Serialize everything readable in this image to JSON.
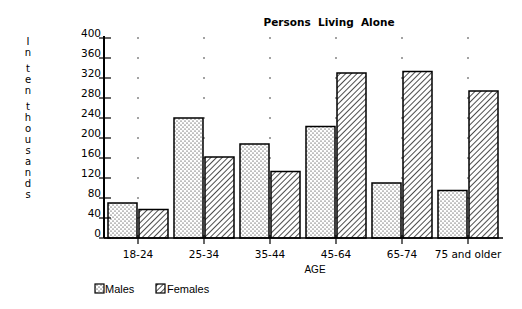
{
  "chart_data": {
    "type": "bar",
    "title": "Persons  Living  Alone",
    "xlabel": "AGE",
    "ylabel": "In ten thousands",
    "ylabel_stacked": [
      "I",
      "n",
      "",
      "t",
      "e",
      "n",
      "",
      "t",
      "h",
      "o",
      "u",
      "s",
      "a",
      "n",
      "d",
      "s"
    ],
    "categories": [
      "18-24",
      "25-34",
      "35-44",
      "45-64",
      "65-74",
      "75 and older"
    ],
    "series": [
      {
        "name": "Males",
        "pattern": "dots",
        "values": [
          70,
          240,
          188,
          223,
          110,
          95
        ]
      },
      {
        "name": "Females",
        "pattern": "diagonal-hatch",
        "values": [
          57,
          162,
          133,
          330,
          333,
          294
        ]
      }
    ],
    "ylim": [
      0,
      400
    ],
    "yticks": [
      0,
      40,
      80,
      120,
      160,
      200,
      240,
      280,
      320,
      360,
      400
    ],
    "grid": "dotted points at tick levels",
    "legend_position": "bottom-left"
  },
  "legend": {
    "items": [
      {
        "label": "Males",
        "pattern": "dots"
      },
      {
        "label": "Females",
        "pattern": "diagonal-hatch"
      }
    ]
  },
  "colors": {
    "ink": "#000000",
    "background": "#ffffff"
  }
}
